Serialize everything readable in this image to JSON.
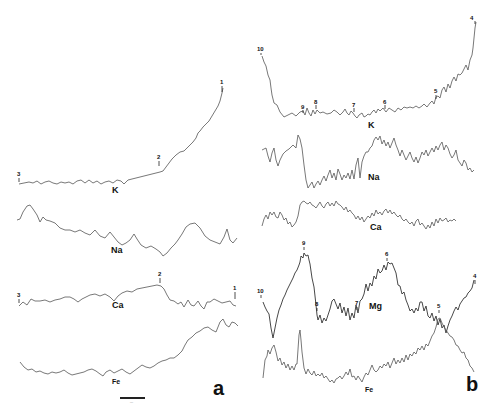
{
  "figure": {
    "panels": [
      {
        "id": "a",
        "label": "a",
        "traces": [
          {
            "element": "K",
            "label": "K"
          },
          {
            "element": "Na",
            "label": "Na"
          },
          {
            "element": "Ca",
            "label": "Ca"
          },
          {
            "element": "Fe",
            "label": "Fe"
          }
        ],
        "markers": {
          "K": [
            "3",
            "2",
            "1"
          ],
          "Ca": [
            "3",
            "2",
            "1"
          ]
        },
        "scale_bar_label": "—"
      },
      {
        "id": "b",
        "label": "b",
        "traces": [
          {
            "element": "K",
            "label": "K"
          },
          {
            "element": "Na",
            "label": "Na"
          },
          {
            "element": "Ca",
            "label": "Ca"
          },
          {
            "element": "Mg",
            "label": "Mg"
          },
          {
            "element": "Fe",
            "label": "Fe"
          }
        ],
        "markers": {
          "K": [
            "10",
            "9",
            "8",
            "7",
            "6",
            "5",
            "4"
          ],
          "Mg": [
            "10",
            "9",
            "8",
            "7",
            "6",
            "5",
            "4"
          ]
        }
      }
    ]
  },
  "labels": {
    "a": {
      "K": "K",
      "Na": "Na",
      "Ca": "Ca",
      "Fe": "Fe",
      "panel": "a",
      "K_m3": "3",
      "K_m2": "2",
      "K_m1": "1",
      "Ca_m3": "3",
      "Ca_m2": "2",
      "Ca_m1": "1"
    },
    "b": {
      "K": "K",
      "Na": "Na",
      "Ca": "Ca",
      "Mg": "Mg",
      "Fe": "Fe",
      "panel": "b",
      "K_m10": "10",
      "K_m9": "9",
      "K_m8": "8",
      "K_m7": "7",
      "K_m6": "6",
      "K_m5": "5",
      "K_m4": "4",
      "Mg_m10": "10",
      "Mg_m9": "9",
      "Mg_m8": "8",
      "Mg_m7": "7",
      "Mg_m6": "6",
      "Mg_m5": "5",
      "Mg_m4": "4"
    }
  }
}
